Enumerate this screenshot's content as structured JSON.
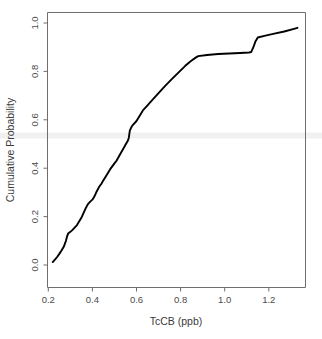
{
  "chart_data": {
    "type": "line",
    "subtype": "empirical-cumulative-distribution",
    "title": "",
    "xlabel": "TcCB (ppb)",
    "ylabel": "Cumulative Probability",
    "xlim": [
      0.185,
      1.355
    ],
    "ylim": [
      0.0,
      1.0
    ],
    "grid": false,
    "legend": null,
    "xticks": [
      0.2,
      0.4,
      0.6,
      0.8,
      1.0,
      1.2
    ],
    "xticklabels": [
      "0.2",
      "0.4",
      "0.6",
      "0.8",
      "1.0",
      "1.2"
    ],
    "yticks": [
      0.0,
      0.2,
      0.4,
      0.6,
      0.8,
      1.0
    ],
    "yticklabels": [
      "0.0",
      "0.2",
      "0.4",
      "0.6",
      "0.8",
      "1.0"
    ],
    "series": [
      {
        "name": "TcCB cumulative probability",
        "color": "#000000",
        "x": [
          0.22,
          0.23,
          0.24,
          0.25,
          0.26,
          0.27,
          0.28,
          0.285,
          0.29,
          0.3,
          0.31,
          0.33,
          0.35,
          0.36,
          0.37,
          0.38,
          0.39,
          0.4,
          0.405,
          0.41,
          0.42,
          0.43,
          0.44,
          0.45,
          0.46,
          0.48,
          0.5,
          0.51,
          0.52,
          0.54,
          0.55,
          0.56,
          0.565,
          0.57,
          0.58,
          0.6,
          0.62,
          0.63,
          0.65,
          0.67,
          0.7,
          0.73,
          0.76,
          0.79,
          0.82,
          0.84,
          0.85,
          0.87,
          0.88,
          0.92,
          0.97,
          1.02,
          1.07,
          1.11,
          1.12,
          1.13,
          1.14,
          1.15,
          1.18,
          1.22,
          1.27,
          1.31,
          1.33
        ],
        "y": [
          0.012,
          0.022,
          0.033,
          0.046,
          0.06,
          0.075,
          0.1,
          0.118,
          0.13,
          0.137,
          0.145,
          0.165,
          0.195,
          0.215,
          0.235,
          0.252,
          0.262,
          0.27,
          0.277,
          0.285,
          0.305,
          0.322,
          0.335,
          0.35,
          0.365,
          0.395,
          0.42,
          0.432,
          0.448,
          0.48,
          0.497,
          0.512,
          0.525,
          0.556,
          0.575,
          0.595,
          0.625,
          0.64,
          0.66,
          0.68,
          0.71,
          0.74,
          0.768,
          0.795,
          0.822,
          0.838,
          0.845,
          0.858,
          0.863,
          0.868,
          0.872,
          0.874,
          0.876,
          0.878,
          0.88,
          0.9,
          0.925,
          0.94,
          0.947,
          0.955,
          0.965,
          0.975,
          0.98
        ]
      }
    ],
    "annotations": {
      "plateau_note": "flat segment near 0.87 between 0.88 and 1.12",
      "jump_note": "sharp rise near 1.13 from 0.88 to 0.94"
    }
  },
  "artifacts": {
    "scan_band_color": "#f1f1f1",
    "scan_band_label": "horizontal-scan-band"
  }
}
